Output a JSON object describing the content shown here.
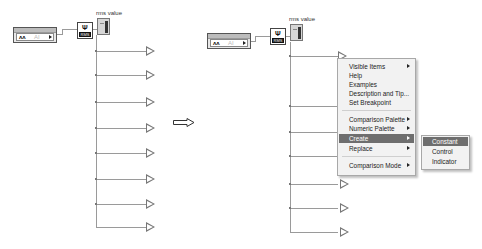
{
  "left_diagram": {
    "daq_assistant": {
      "wave_glyph": "ʌʌ",
      "channel_label": "AI"
    },
    "rms_function": {
      "symbol": "Ψ",
      "label": "RMS"
    },
    "indicator": {
      "label": "rms value"
    },
    "comparison_glyph": ">",
    "branch_count": 8
  },
  "transition_arrow": {
    "icon": "right-arrow-icon"
  },
  "right_diagram": {
    "daq_assistant": {
      "wave_glyph": "ʌʌ",
      "channel_label": "AI"
    },
    "rms_function": {
      "symbol": "Ψ",
      "label": "RMS"
    },
    "indicator": {
      "label": "rms value"
    },
    "comparison_glyph": ">"
  },
  "context_menu": {
    "items": [
      {
        "label": "Visible Items",
        "submenu": true
      },
      {
        "label": "Help",
        "submenu": false
      },
      {
        "label": "Examples",
        "submenu": false
      },
      {
        "label": "Description and Tip...",
        "submenu": false
      },
      {
        "label": "Set Breakpoint",
        "submenu": false
      },
      {
        "label": "Comparison Palette",
        "submenu": true
      },
      {
        "label": "Numeric Palette",
        "submenu": true
      },
      {
        "label": "Create",
        "submenu": true,
        "selected": true
      },
      {
        "label": "Replace",
        "submenu": true
      },
      {
        "label": "Comparison Mode",
        "submenu": true
      }
    ]
  },
  "create_submenu": {
    "items": [
      {
        "label": "Constant",
        "selected": true
      },
      {
        "label": "Control"
      },
      {
        "label": "Indicator"
      }
    ]
  }
}
